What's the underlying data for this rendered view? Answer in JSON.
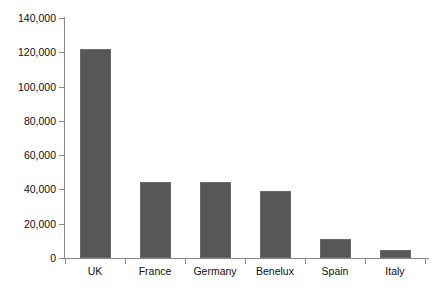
{
  "chart_data": {
    "type": "bar",
    "title": "",
    "xlabel": "",
    "ylabel": "",
    "categories": [
      "UK",
      "France",
      "Germany",
      "Benelux",
      "Spain",
      "Italy"
    ],
    "values": [
      122000,
      44500,
      44500,
      39000,
      10800,
      4700
    ],
    "ylim": [
      0,
      140000
    ],
    "ytick_values": [
      0,
      20000,
      40000,
      60000,
      80000,
      100000,
      120000,
      140000
    ],
    "ytick_labels": [
      "0",
      "20,000",
      "40,000",
      "60,000",
      "80,000",
      "100,000",
      "120,000",
      "140,000"
    ],
    "grid": false,
    "legend": "none",
    "bar_color": "#575757",
    "axis_color": "#8a8a8a",
    "text_color": "#0f0f0f"
  }
}
